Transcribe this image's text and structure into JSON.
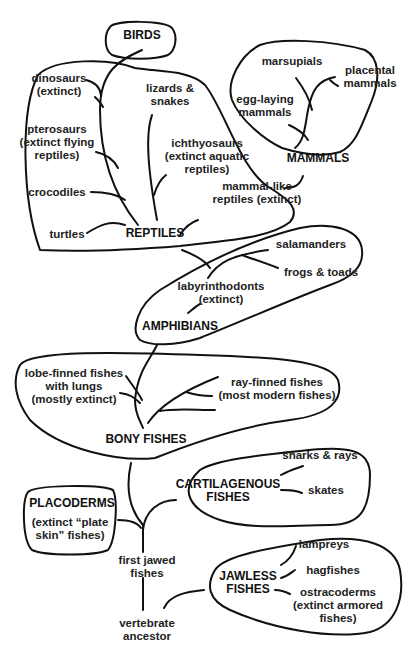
{
  "colors": {
    "stroke": "#111111",
    "text": "#222222",
    "background": "#ffffff"
  },
  "groups": {
    "birds": "BIRDS",
    "reptiles": "REPTILES",
    "mammals": "MAMMALS",
    "amphibians": "AMPHIBIANS",
    "bony_fishes": "BONY FISHES",
    "cartilagenous_fishes": [
      "CARTILAGENOUS",
      "FISHES"
    ],
    "placoderms": "PLACODERMS",
    "jawless_fishes": [
      "JAWLESS",
      "FISHES"
    ]
  },
  "labels": {
    "dinosaurs": [
      "dinosaurs",
      "(extinct)"
    ],
    "lizards": [
      "lizards &",
      "snakes"
    ],
    "pterosaurs": [
      "pterosaurs",
      "(extinct flying",
      "reptiles)"
    ],
    "ichthyosaurs": [
      "ichthyosaurs",
      "(extinct aquatic",
      "reptiles)"
    ],
    "crocodiles": "crocodiles",
    "mammal_like": [
      "mammal-like",
      "reptiles (extinct)"
    ],
    "turtles": "turtles",
    "marsupials": "marsupials",
    "placental": [
      "placental",
      "mammals"
    ],
    "egg_laying": [
      "egg-laying",
      "mammals"
    ],
    "salamanders": "salamanders",
    "frogs": "frogs & toads",
    "labyrinthodonts": [
      "labyrinthodonts",
      "(extinct)"
    ],
    "lobe_finned": [
      "lobe-finned fishes",
      "with lungs",
      "(mostly extinct)"
    ],
    "ray_finned": [
      "ray-finned fishes",
      "(most modern fishes)"
    ],
    "sharks": "sharks & rays",
    "skates": "skates",
    "placoderms_desc": [
      "(extinct “plate",
      "skin” fishes)"
    ],
    "first_jawed": [
      "first jawed",
      "fishes"
    ],
    "lampreys": "lampreys",
    "hagfishes": "hagfishes",
    "ostracoderms": [
      "ostracoderms",
      "(extinct armored",
      "fishes)"
    ],
    "vertebrate": [
      "vertebrate",
      "ancestor"
    ]
  }
}
